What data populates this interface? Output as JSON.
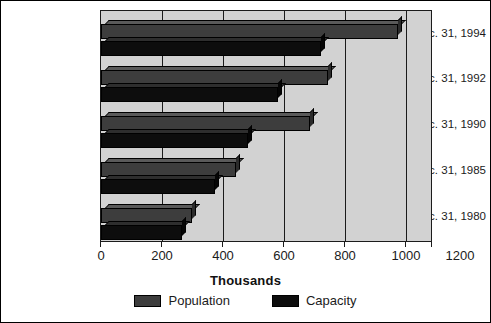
{
  "chart_data": {
    "type": "bar",
    "orientation": "horizontal",
    "title": "",
    "xlabel": "Thousands",
    "ylabel": "",
    "xlim": [
      0,
      1200
    ],
    "xticks": [
      0,
      200,
      400,
      600,
      800,
      1000,
      1200
    ],
    "xtick_labels": [
      "0",
      "200",
      "400",
      "600",
      "800",
      "1000",
      "1200"
    ],
    "grid": true,
    "grid_axis": "x",
    "legend_position": "bottom",
    "categories": [
      "Dec. 31, 1994",
      "Dec. 31, 1992",
      "Dec. 31, 1990",
      "Dec. 31, 1985",
      "Dec. 31, 1980"
    ],
    "series": [
      {
        "name": "Population",
        "color": "#3d3d3d",
        "values": [
          1080,
          825,
          760,
          490,
          330
        ]
      },
      {
        "name": "Capacity",
        "color": "#0d0d0d",
        "values": [
          800,
          645,
          535,
          415,
          293
        ]
      }
    ]
  },
  "legend": {
    "items": [
      {
        "label": "Population",
        "color": "#3d3d3d"
      },
      {
        "label": "Capacity",
        "color": "#0d0d0d"
      }
    ]
  },
  "axis": {
    "title": "Thousands"
  }
}
